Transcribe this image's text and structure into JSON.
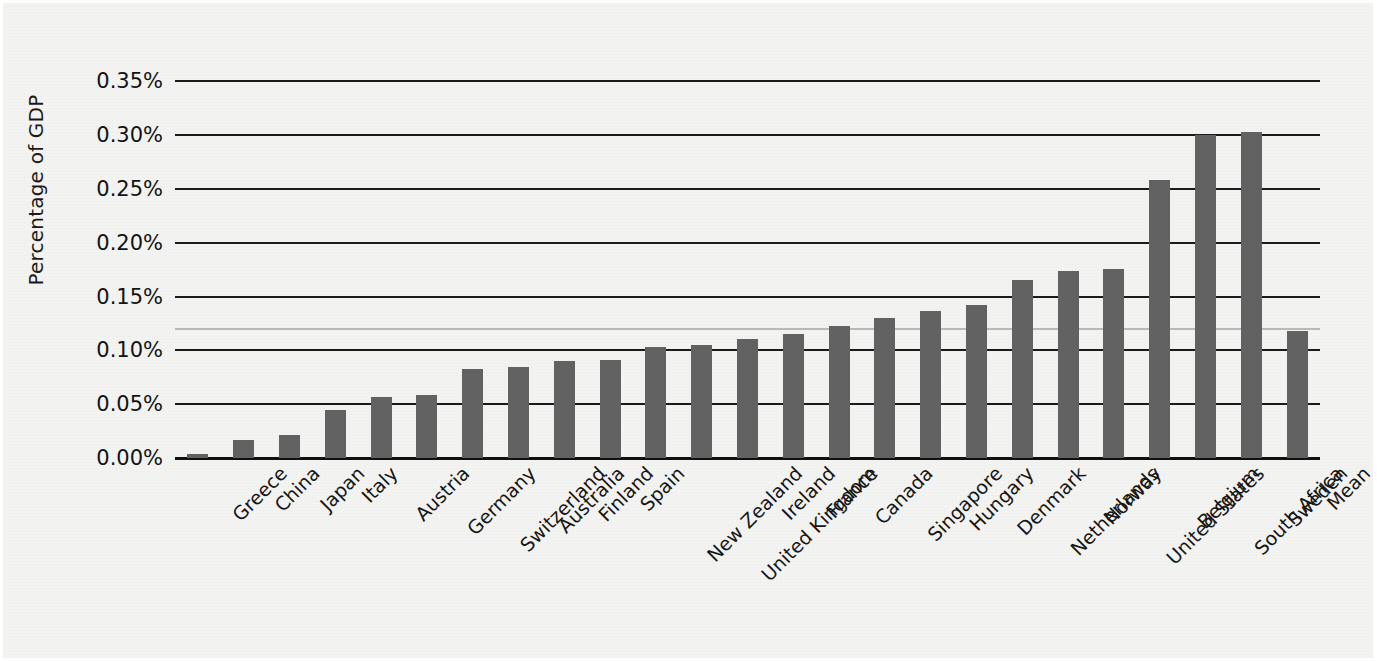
{
  "chart_data": {
    "type": "bar",
    "title": "",
    "subtitle": "",
    "xlabel": "",
    "ylabel": "Percentage of GDP",
    "ylim": [
      0,
      0.355
    ],
    "yticks": [
      0.0,
      0.05,
      0.1,
      0.15,
      0.2,
      0.25,
      0.3,
      0.35
    ],
    "ytick_labels": [
      "0.00%",
      "0.05%",
      "0.10%",
      "0.15%",
      "0.20%",
      "0.25%",
      "0.30%",
      "0.35%"
    ],
    "grid": true,
    "grid_axis": "y",
    "legend": null,
    "legend_position": "none",
    "bar_color": "#626262",
    "gridline_color": "#1b1b1b",
    "mean_line_color": "#b9b9b9",
    "background_color": "#f3f3f1",
    "categories": [
      "Greece",
      "China",
      "Japan",
      "Italy",
      "Austria",
      "Germany",
      "Switzerland",
      "Australia",
      "Finland",
      "Spain",
      "New Zealand",
      "United Kingdom",
      "Ireland",
      "France",
      "Canada",
      "Singapore",
      "Hungary",
      "Denmark",
      "Netherlands",
      "Norway",
      "United States",
      "Belgium",
      "South Africa",
      "Sweden",
      "Mean"
    ],
    "values": [
      0.004,
      0.017,
      0.021,
      0.045,
      0.057,
      0.059,
      0.083,
      0.085,
      0.09,
      0.091,
      0.103,
      0.105,
      0.111,
      0.115,
      0.123,
      0.13,
      0.137,
      0.142,
      0.165,
      0.174,
      0.176,
      0.258,
      0.3,
      0.303,
      0.118
    ],
    "value_unit": "%",
    "annotations": [
      {
        "name": "mean-reference-line",
        "type": "hline",
        "value": 0.12,
        "label": ""
      }
    ]
  }
}
